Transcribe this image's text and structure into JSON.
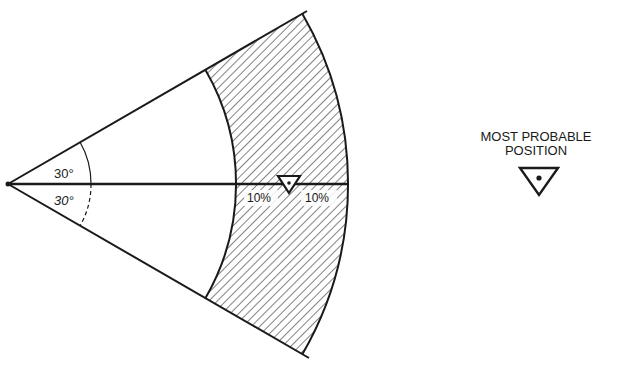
{
  "diagram": {
    "angles": {
      "upper": "30°",
      "lower": "30°"
    },
    "percent_labels": {
      "left": "10%",
      "right": "10%"
    },
    "legend": {
      "line1": "MOST PROBABLE",
      "line2": "POSITION",
      "symbol": "inverted-triangle-with-dot"
    },
    "colors": {
      "ink": "#1a1a1a",
      "background": "#ffffff"
    }
  }
}
